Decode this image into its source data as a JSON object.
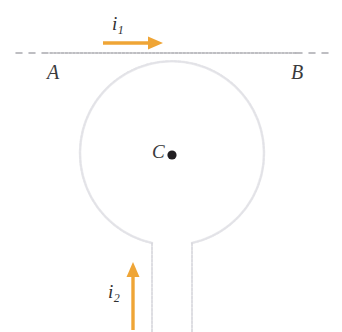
{
  "figure": {
    "background_color": "#ffffff",
    "width": 342,
    "height": 332
  },
  "labels": {
    "endpoint_left": "A",
    "endpoint_right": "B",
    "center": "C",
    "current_straight_symbol": "i",
    "current_straight_subscript": "1",
    "current_loop_symbol": "i",
    "current_loop_subscript": "2"
  },
  "colors": {
    "arrow_orange": "#efa536",
    "wire_gray": "#d8d8dd",
    "dashed_line_gray": "#a9a9ae",
    "label_text": "#3a3a3c",
    "center_dot": "#221f22"
  },
  "geometry": {
    "straight_wire_y": 53,
    "straight_wire_x_start": 16,
    "straight_wire_x_end": 330,
    "loop_center_x": 172,
    "loop_center_y": 155,
    "loop_radius": 92,
    "lead_left_x": 152,
    "lead_right_x": 192,
    "lead_top_y": 243,
    "lead_bottom_y": 332,
    "center_dot_x": 172,
    "center_dot_y": 155,
    "center_dot_radius": 4.5
  },
  "arrows": {
    "straight_current": {
      "name": "i1",
      "direction": "right",
      "x_start": 103,
      "x_end": 162,
      "y": 43
    },
    "loop_current": {
      "name": "i2",
      "direction": "up",
      "x": 133,
      "y_start": 330,
      "y_end": 263
    }
  }
}
